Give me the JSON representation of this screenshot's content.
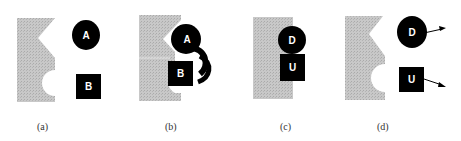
{
  "figure": {
    "panels": [
      {
        "id": "a",
        "caption": "(a)",
        "circle_label": "A",
        "square_label": "B"
      },
      {
        "id": "b",
        "caption": "(b)",
        "circle_label": "A",
        "square_label": "B"
      },
      {
        "id": "c",
        "caption": "(c)",
        "circle_label": "D",
        "square_label": "U"
      },
      {
        "id": "d",
        "caption": "(d)",
        "circle_label": "D",
        "square_label": "U"
      }
    ],
    "colors": {
      "obstacle": "#c4c4c4",
      "object": "#000000",
      "label": "#ffffff"
    }
  }
}
